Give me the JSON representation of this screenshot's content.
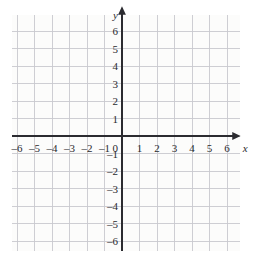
{
  "figure": {
    "kind": "cartesian-coordinate-grid",
    "width": 253,
    "height": 271,
    "background_color": "#ffffff",
    "grid_fill_color": "#fcfcfb",
    "gridline_color": "#c9c9ce",
    "axis_color": "#2b2b30",
    "label_color": "#2a2a2e"
  },
  "axes": {
    "x_axis_name": "x",
    "y_axis_name": "y",
    "origin_label": "0"
  },
  "chart_data": {
    "type": "scatter",
    "title": "",
    "subtitle": "",
    "xlabel": "x",
    "ylabel": "y",
    "grid": true,
    "legend": null,
    "series": [],
    "annotations": [],
    "xlim": [
      -6.5,
      6.5
    ],
    "ylim": [
      -6.5,
      6.5
    ],
    "x_ticks": [
      -6,
      -5,
      -4,
      -3,
      -2,
      -1,
      0,
      1,
      2,
      3,
      4,
      5,
      6
    ],
    "y_ticks": [
      -6,
      -5,
      -4,
      -3,
      -2,
      -1,
      0,
      1,
      2,
      3,
      4,
      5,
      6
    ],
    "x_tick_labels": [
      "–6",
      "–5",
      "–4",
      "–3",
      "–2",
      "–1",
      "0",
      "1",
      "2",
      "3",
      "4",
      "5",
      "6"
    ],
    "y_tick_labels": [
      "–6",
      "–5",
      "–4",
      "–3",
      "–2",
      "–1",
      "0",
      "1",
      "2",
      "3",
      "4",
      "5",
      "6"
    ],
    "x_tick_interval": 1,
    "y_tick_interval": 1
  },
  "geometry": {
    "origin_x": 122,
    "origin_y": 136,
    "unit_px": 17.5,
    "grid_left": 12,
    "grid_top": 15,
    "grid_width": 228,
    "grid_height": 236,
    "x_arrow_tip": 238,
    "y_arrow_tip": 9
  }
}
